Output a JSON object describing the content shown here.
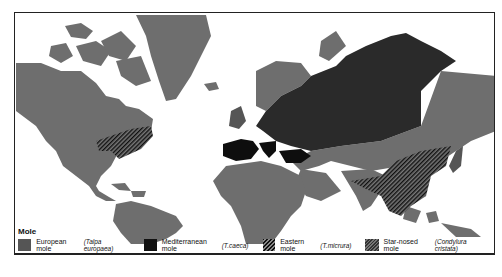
{
  "legend": {
    "title": "Mole",
    "items": [
      {
        "common": "European mole",
        "scientific": "(Talpa europaea)",
        "pattern": "dark-gray"
      },
      {
        "common": "Mediterranean mole",
        "scientific": "(T.caeca)",
        "pattern": "black"
      },
      {
        "common": "Eastern mole",
        "scientific": "(T.micrura)",
        "pattern": "diagonal-hatch"
      },
      {
        "common": "Star-nosed mole",
        "scientific": "(Condylura cristata)",
        "pattern": "fine-hatch"
      }
    ]
  },
  "colors": {
    "land": "#6e6e6e",
    "european": "#2a2a2a",
    "mediterranean": "#0e0e0e",
    "water": "#ffffff",
    "frame": "#222222"
  }
}
